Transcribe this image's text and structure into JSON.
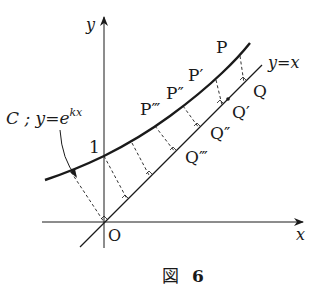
{
  "figure": {
    "caption": "図 6",
    "caption_kanji": "図",
    "caption_number": "6"
  },
  "axes": {
    "x_label": "x",
    "y_label": "y",
    "origin_label": "O",
    "y_intercept_label": "1"
  },
  "curve": {
    "name": "C",
    "label_prefix": "C ; y=e",
    "label_exponent": "kx",
    "equation": "y = e^{kx}"
  },
  "line": {
    "label": "y=x"
  },
  "points_on_curve": [
    "P",
    "P′",
    "P″",
    "P‴"
  ],
  "points_on_line": [
    "Q",
    "Q′",
    "Q″",
    "Q‴"
  ],
  "colors": {
    "ink": "#1a1a1a",
    "background": "#ffffff"
  }
}
